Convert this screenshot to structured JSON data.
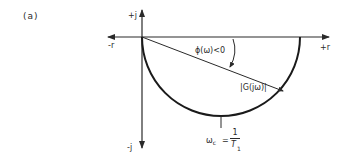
{
  "figure": {
    "panel_label": "(a)",
    "axes": {
      "positive_imag_label": "+j",
      "negative_imag_label": "-j",
      "negative_real_label": "-r",
      "positive_real_label": "+r"
    },
    "annotations": {
      "phase_label": "ϕ(ω)<0",
      "magnitude_label": "|G(jω)|",
      "corner_freq_label": "ω",
      "corner_freq_sub": "c",
      "corner_freq_eq": "=",
      "corner_freq_num": "1",
      "corner_freq_den": "T",
      "corner_freq_den_sub": "1"
    },
    "colors": {
      "ink": "#2a2a2a",
      "background": "#ffffff"
    }
  }
}
